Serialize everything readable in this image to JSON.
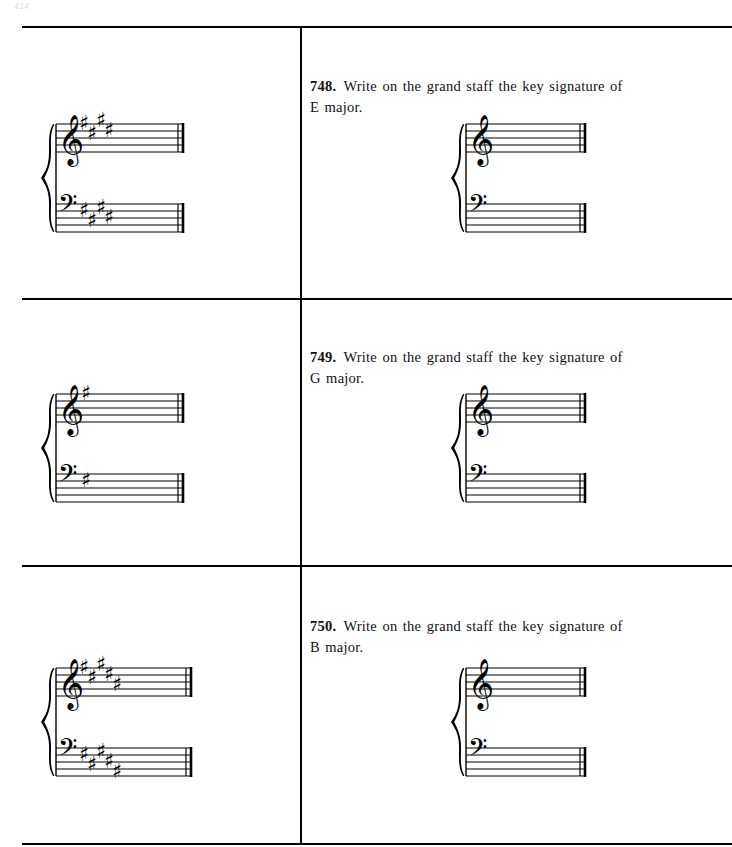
{
  "page": {
    "page_number": "424",
    "width": 732,
    "height": 847,
    "background_color": "#ffffff",
    "ink_color": "#000000"
  },
  "layout": {
    "column_divider_x": 300,
    "rules_y": [
      26,
      298,
      565,
      843
    ],
    "left_column_label": "answer-staves",
    "right_column_label": "question-and-blank-staves"
  },
  "exercises": [
    {
      "number": "748.",
      "prompt": "Write on the grand staff the key signature of",
      "subject": "E major.",
      "key": "E major",
      "accidental_type": "sharp",
      "accidental_count": 4,
      "accidental_glyph": "♯",
      "answer_staff": {
        "label": "answer-grand-staff-748",
        "clefs": [
          "treble",
          "bass"
        ],
        "barline": "final-double",
        "treble_sharp_steps": [
          8,
          5,
          9,
          6
        ],
        "bass_sharp_steps": [
          6,
          3,
          7,
          4
        ]
      },
      "blank_staff": {
        "label": "blank-grand-staff-748",
        "clefs": [
          "treble",
          "bass"
        ],
        "barline": "final-double"
      }
    },
    {
      "number": "749.",
      "prompt": "Write on the grand staff the key signature of",
      "subject": "G major.",
      "key": "G major",
      "accidental_type": "sharp",
      "accidental_count": 1,
      "accidental_glyph": "♯",
      "answer_staff": {
        "label": "answer-grand-staff-749",
        "clefs": [
          "treble",
          "bass"
        ],
        "barline": "final-double",
        "treble_sharp_steps": [
          8
        ],
        "bass_sharp_steps": [
          6
        ]
      },
      "blank_staff": {
        "label": "blank-grand-staff-749",
        "clefs": [
          "treble",
          "bass"
        ],
        "barline": "final-double"
      }
    },
    {
      "number": "750.",
      "prompt": "Write on the grand staff the key signature of",
      "subject": "B major.",
      "key": "B major",
      "accidental_type": "sharp",
      "accidental_count": 5,
      "accidental_glyph": "♯",
      "answer_staff": {
        "label": "answer-grand-staff-750",
        "clefs": [
          "treble",
          "bass"
        ],
        "barline": "final-double",
        "treble_sharp_steps": [
          8,
          5,
          9,
          6,
          3
        ],
        "bass_sharp_steps": [
          6,
          3,
          7,
          4,
          1
        ]
      },
      "blank_staff": {
        "label": "blank-grand-staff-750",
        "clefs": [
          "treble",
          "bass"
        ],
        "barline": "final-double"
      }
    }
  ]
}
